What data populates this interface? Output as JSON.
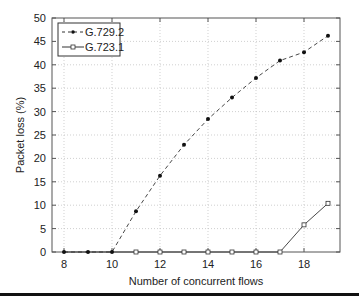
{
  "chart_data": {
    "type": "line",
    "title": "",
    "xlabel": "Number of concurrent flows",
    "ylabel": "Packet loss (%)",
    "xlim": [
      7.5,
      19.5
    ],
    "ylim": [
      0,
      50
    ],
    "xticks": [
      8,
      10,
      12,
      14,
      16,
      18
    ],
    "yticks": [
      0,
      5,
      10,
      15,
      20,
      25,
      30,
      35,
      40,
      45,
      50
    ],
    "grid": true,
    "legend_position": "upper left",
    "x": [
      8,
      9,
      10,
      11,
      12,
      13,
      14,
      15,
      16,
      17,
      18,
      19
    ],
    "series": [
      {
        "name": "G.729.2",
        "style": "dashed",
        "marker": "filled-dot",
        "values": [
          0,
          0,
          0,
          8.7,
          16.3,
          22.9,
          28.4,
          33.0,
          37.2,
          40.9,
          42.7,
          46.2
        ]
      },
      {
        "name": "G.723.1",
        "style": "solid",
        "marker": "open-square",
        "values": [
          0,
          0,
          0,
          0,
          0,
          0,
          0,
          0,
          0,
          0,
          5.8,
          10.4
        ]
      }
    ]
  },
  "legend": {
    "items": [
      "G.729.2",
      "G.723.1"
    ]
  },
  "axes": {
    "xlabel": "Number of concurrent flows",
    "ylabel": "Packet loss (%)"
  }
}
